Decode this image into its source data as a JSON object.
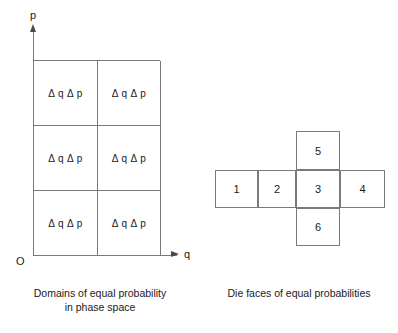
{
  "figure": {
    "type": "two-panel-diagram",
    "background_color": "#ffffff",
    "line_color": "#7a7a7a",
    "text_color": "#1a1a1a"
  },
  "phase_space": {
    "axes": {
      "vertical_label": "p",
      "horizontal_label": "q",
      "origin_label": "O"
    },
    "grid": {
      "columns": 2,
      "rows": 3,
      "cells": [
        "Δ q Δ p",
        "Δ q Δ p",
        "Δ q Δ p",
        "Δ q Δ p",
        "Δ q Δ p",
        "Δ q Δ p"
      ]
    },
    "caption": {
      "line1": "Domains of equal probability",
      "line2": "in phase space"
    }
  },
  "die_net": {
    "layout": "cross",
    "row_faces": [
      "1",
      "2",
      "3",
      "4"
    ],
    "column_faces": [
      "5",
      "3",
      "6"
    ],
    "faces": {
      "face_1": "1",
      "face_2": "2",
      "face_3": "3",
      "face_4": "4",
      "face_5": "5",
      "face_6": "6"
    },
    "caption": {
      "line1": "Die faces of equal probabilities"
    }
  }
}
